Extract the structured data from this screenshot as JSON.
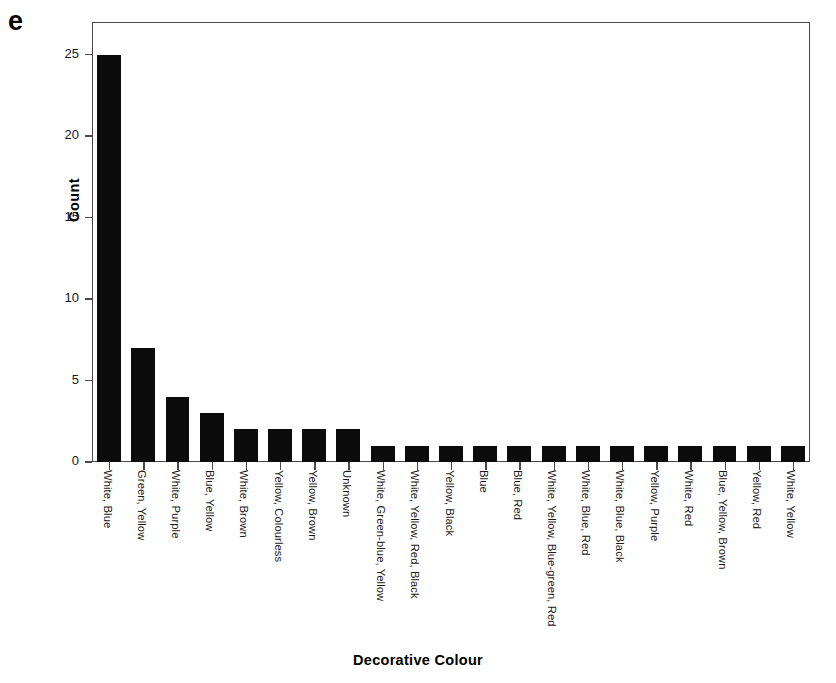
{
  "panel": {
    "label": "e"
  },
  "chart_data": {
    "type": "bar",
    "title": "",
    "xlabel": "Decorative Colour",
    "ylabel": "Count",
    "ylim": [
      0,
      27
    ],
    "yticks": [
      0,
      5,
      10,
      15,
      20,
      25
    ],
    "grid": false,
    "legend": null,
    "bar_color": "#0b0b0b",
    "axis_color": "#4a4a4a",
    "categories": [
      "White, Blue",
      "Green, Yellow",
      "White, Purple",
      "Blue, Yellow",
      "White, Brown",
      "Yellow, Colourless",
      "Yellow, Brown",
      "Unknown",
      "White, Green-blue, Yellow",
      "White, Yellow, Red, Black",
      "Yellow, Black",
      "Blue",
      "Blue, Red",
      "White, Yellow, Blue-green, Red",
      "White, Blue, Red",
      "White, Blue, Black",
      "Yellow, Purple",
      "White, Red",
      "Blue, Yellow, Brown",
      "Yellow, Red",
      "White, Yellow"
    ],
    "values": [
      25,
      7,
      4,
      3,
      2,
      2,
      2,
      2,
      1,
      1,
      1,
      1,
      1,
      1,
      1,
      1,
      1,
      1,
      1,
      1,
      1
    ]
  }
}
